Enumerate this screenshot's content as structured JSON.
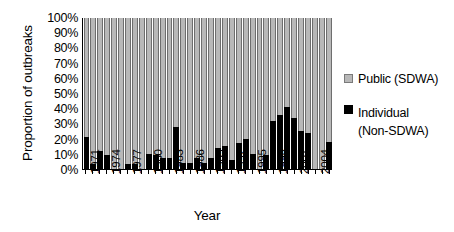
{
  "chart_data": {
    "type": "bar",
    "subtype": "stacked-100-percent",
    "title": "",
    "xlabel": "Year",
    "ylabel": "Proportion of outbreaks",
    "ylim": [
      0,
      100
    ],
    "ytick_labels": [
      "100%",
      "90%",
      "80%",
      "70%",
      "60%",
      "50%",
      "40%",
      "30%",
      "20%",
      "10%",
      "0%"
    ],
    "ytick_values": [
      100,
      90,
      80,
      70,
      60,
      50,
      40,
      30,
      20,
      10,
      0
    ],
    "grid": false,
    "legend_position": "right",
    "categories": [
      1971,
      1972,
      1973,
      1974,
      1975,
      1976,
      1977,
      1978,
      1979,
      1980,
      1981,
      1982,
      1983,
      1984,
      1985,
      1986,
      1987,
      1988,
      1989,
      1990,
      1991,
      1992,
      1993,
      1994,
      1995,
      1996,
      1997,
      1998,
      1999,
      2000,
      2001,
      2002,
      2003,
      2004,
      2005,
      2006
    ],
    "xtick_labels": [
      "1971",
      "1974",
      "1977",
      "1980",
      "1983",
      "1986",
      "1989",
      "1992",
      "1995",
      "1998",
      "2001",
      "2004"
    ],
    "xtick_indices": [
      0,
      3,
      6,
      9,
      12,
      15,
      18,
      21,
      24,
      27,
      30,
      33
    ],
    "series": [
      {
        "name": "Individual (Non-SDWA)",
        "color": "#000000",
        "values": [
          21,
          3,
          12,
          9,
          0,
          0,
          3,
          3,
          0,
          10,
          9,
          7,
          7,
          28,
          4,
          4,
          7,
          4,
          7,
          14,
          15,
          6,
          17,
          20,
          10,
          0,
          9,
          32,
          36,
          41,
          34,
          25,
          24,
          0,
          0,
          18
        ]
      },
      {
        "name": "Public (SDWA)",
        "color": "#b8b8b8",
        "values": [
          79,
          97,
          88,
          91,
          100,
          100,
          97,
          97,
          100,
          90,
          91,
          93,
          93,
          72,
          96,
          96,
          93,
          96,
          93,
          86,
          85,
          94,
          83,
          80,
          90,
          100,
          91,
          68,
          64,
          59,
          66,
          75,
          76,
          100,
          100,
          82
        ]
      }
    ]
  },
  "legend": {
    "items": [
      {
        "label": "Public (SDWA)",
        "sublabel": "",
        "swatch": "public-swatch"
      },
      {
        "label": "Individual",
        "sublabel": "(Non-SDWA)",
        "swatch": "individual-swatch"
      }
    ]
  },
  "axes": {
    "y_title": "Proportion of outbreaks",
    "x_title": "Year"
  }
}
